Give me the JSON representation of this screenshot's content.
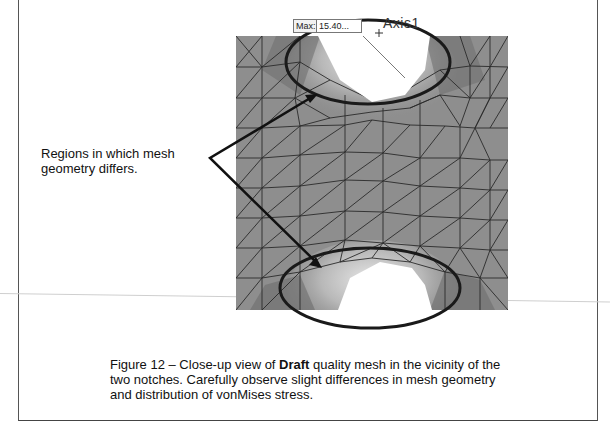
{
  "figure": {
    "callout_text": "Regions in which mesh geometry differs.",
    "probe": {
      "label": "Max:",
      "value": "15.40..."
    },
    "axis_label": "Axis1",
    "colors": {
      "mesh_fill": "#8e8e8e",
      "mesh_lines": "#2a2a2a",
      "highlight_ellipse": "#1a1a1a",
      "notch_cutout": "#ffffff"
    }
  },
  "caption": {
    "prefix": "Figure 12 – Close-up view of ",
    "bold": "Draft",
    "suffix": " quality mesh in the vicinity of the two notches.  Carefully observe slight differences in mesh geometry and distribution of vonMises stress."
  }
}
